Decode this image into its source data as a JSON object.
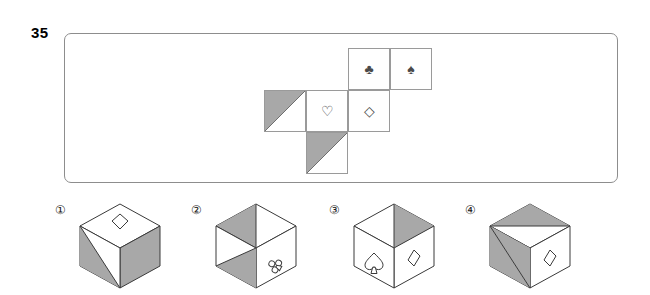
{
  "question": {
    "number": "35"
  },
  "colors": {
    "shade_gray": "#a8a8a8",
    "line": "#4a4a4a",
    "panel_border": "#8d8d8d",
    "cell_border": "#9a9a9a"
  },
  "net": {
    "description": "unfolded-cube-net",
    "rows": 3,
    "cols": 4,
    "cell_size": 42,
    "cells": [
      {
        "id": "cell-top-club",
        "col": 2,
        "row": 0,
        "symbol": "♣",
        "symbol_name": "club",
        "shade": "none"
      },
      {
        "id": "cell-top-spade",
        "col": 3,
        "row": 0,
        "symbol": "♠",
        "symbol_name": "spade",
        "shade": "none"
      },
      {
        "id": "cell-mid-shaded",
        "col": 0,
        "row": 1,
        "symbol": "",
        "symbol_name": "none",
        "shade": "upper-left"
      },
      {
        "id": "cell-mid-heart",
        "col": 1,
        "row": 1,
        "symbol": "♡",
        "symbol_name": "heart",
        "shade": "none"
      },
      {
        "id": "cell-mid-diamond",
        "col": 2,
        "row": 1,
        "symbol": "◇",
        "symbol_name": "diamond",
        "shade": "none"
      },
      {
        "id": "cell-bottom-shaded",
        "col": 1,
        "row": 2,
        "symbol": "",
        "symbol_name": "none",
        "shade": "upper-left"
      }
    ]
  },
  "options": [
    {
      "label": "①",
      "name": "option-1",
      "top_face": {
        "symbol": "diamond",
        "shade": "none"
      },
      "front_face": {
        "symbol": "none",
        "shade": "lower-left"
      },
      "right_face": {
        "symbol": "none",
        "shade": "full"
      }
    },
    {
      "label": "②",
      "name": "option-2",
      "top_face": {
        "symbol": "none",
        "shade": "left-triangle"
      },
      "front_face": {
        "symbol": "none",
        "shade": "lower-right"
      },
      "right_face": {
        "symbol": "club",
        "shade": "none"
      }
    },
    {
      "label": "③",
      "name": "option-3",
      "top_face": {
        "symbol": "none",
        "shade": "right-triangle"
      },
      "front_face": {
        "symbol": "spade",
        "shade": "none"
      },
      "right_face": {
        "symbol": "diamond",
        "shade": "none"
      }
    },
    {
      "label": "④",
      "name": "option-4",
      "top_face": {
        "symbol": "none",
        "shade": "left-triangle"
      },
      "front_face": {
        "symbol": "none",
        "shade": "upper-right-triangle"
      },
      "right_face": {
        "symbol": "diamond",
        "shade": "none"
      }
    }
  ]
}
